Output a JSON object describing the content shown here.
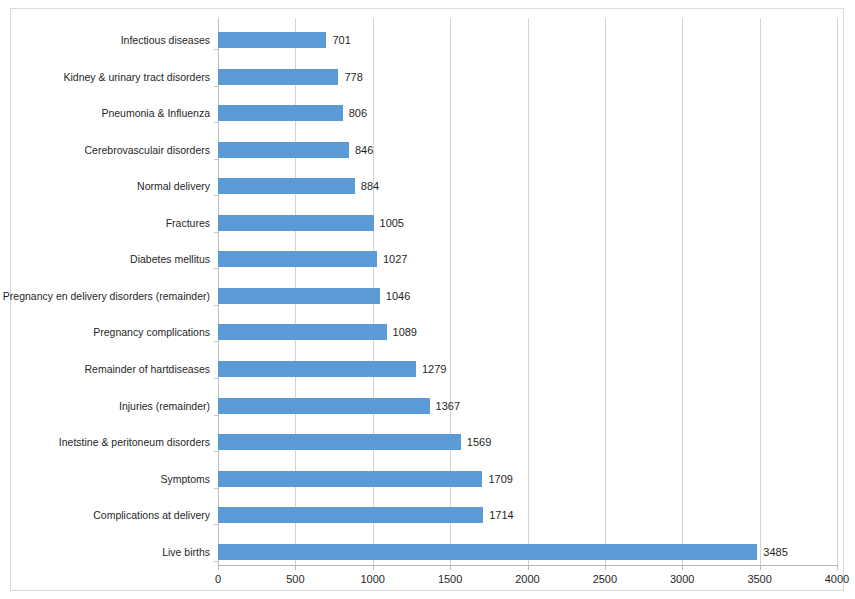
{
  "chart_data": {
    "type": "bar",
    "orientation": "horizontal",
    "title": "",
    "subtitle": "",
    "xlabel": "",
    "ylabel": "",
    "xlim": [
      0,
      4000
    ],
    "xticks": [
      0,
      500,
      1000,
      1500,
      2000,
      2500,
      3000,
      3500,
      4000
    ],
    "xtick_labels": [
      "0",
      "500",
      "1000",
      "1500",
      "2000",
      "2500",
      "3000",
      "3500",
      "4000"
    ],
    "grid": "vertical",
    "legend": "none",
    "series_color": "#5b9bd5",
    "data_labels_shown": true,
    "categories": [
      "Infectious diseases",
      "Kidney & urinary tract disorders",
      "Pneumonia & Influenza",
      "Cerebrovasculair disorders",
      "Normal delivery",
      "Fractures",
      "Diabetes mellitus",
      "Pregnancy en delivery disorders (remainder)",
      "Pregnancy complications",
      "Remainder of hartdiseases",
      "Injuries (remainder)",
      "Inetstine & peritoneum disorders",
      "Symptoms",
      "Complications at delivery",
      "Live births"
    ],
    "values": [
      701,
      778,
      806,
      846,
      884,
      1005,
      1027,
      1046,
      1089,
      1279,
      1367,
      1569,
      1709,
      1714,
      3485
    ],
    "value_labels": [
      "701",
      "778",
      "806",
      "846",
      "884",
      "1005",
      "1027",
      "1046",
      "1089",
      "1279",
      "1367",
      "1569",
      "1709",
      "1714",
      "3485"
    ]
  },
  "colors": {
    "bar": "#5b9bd5",
    "gridline": "#d4d4d4",
    "axis": "#b7b7b7",
    "frame": "#d9d9d9",
    "text": "#1f1f1f",
    "background": "#ffffff"
  }
}
